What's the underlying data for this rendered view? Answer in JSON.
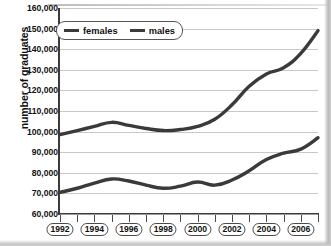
{
  "chart_data": {
    "type": "line",
    "title": "",
    "xlabel": "",
    "ylabel": "number of graduates",
    "ylim": [
      60000,
      160000
    ],
    "xlim": [
      1992,
      2007
    ],
    "grid": true,
    "legend_position": "top-left inside plot",
    "ytick_labels": [
      "160,000",
      "150,000",
      "140,000",
      "130,000",
      "120,000",
      "110,000",
      "100,000",
      "90,000",
      "80,000",
      "70,000",
      "60,000"
    ],
    "ytick_values": [
      160000,
      150000,
      140000,
      130000,
      120000,
      110000,
      100000,
      90000,
      80000,
      70000,
      60000
    ],
    "xtick_labels": [
      "1992",
      "1994",
      "1996",
      "1998",
      "2000",
      "2002",
      "2004",
      "2006"
    ],
    "xtick_values": [
      1992,
      1994,
      1996,
      1998,
      2000,
      2002,
      2004,
      2006
    ],
    "x": [
      1992,
      1993,
      1994,
      1995,
      1996,
      1997,
      1998,
      1999,
      2000,
      2001,
      2002,
      2003,
      2004,
      2005,
      2006,
      2007
    ],
    "series": [
      {
        "name": "females",
        "color": "#3a3a3a",
        "values": [
          98500,
          100500,
          102500,
          104500,
          103000,
          101500,
          100500,
          101000,
          102500,
          106000,
          113000,
          122000,
          128000,
          131000,
          138000,
          149000
        ]
      },
      {
        "name": "males",
        "color": "#3a3a3a",
        "values": [
          70500,
          72500,
          75000,
          77000,
          76000,
          74000,
          72500,
          73500,
          75500,
          74000,
          76500,
          81000,
          86500,
          89500,
          91500,
          97000
        ]
      }
    ]
  },
  "legend": {
    "items": [
      {
        "label": "females"
      },
      {
        "label": "males"
      }
    ]
  }
}
